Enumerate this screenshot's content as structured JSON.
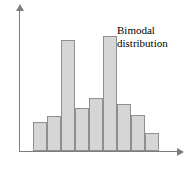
{
  "chart_data": {
    "type": "bar",
    "title": "",
    "subtitle": "",
    "xlabel": "",
    "ylabel": "",
    "categories": [
      "1",
      "2",
      "3",
      "4",
      "5",
      "6",
      "7",
      "8",
      "9"
    ],
    "values": [
      32,
      38,
      121,
      47,
      57,
      125,
      51,
      39,
      20
    ],
    "ylim": [
      0,
      140
    ],
    "grid": false,
    "legend": null,
    "annotations": [
      {
        "name": "bimodal-label",
        "line1": "Bimodal",
        "line2": "distribution"
      }
    ],
    "bar_fill": "#d6d6d6",
    "bar_stroke": "#8f8f8f",
    "axis_color": "#7d7d7d",
    "background": "#ffffff"
  },
  "axes": {
    "y_axis_name": "y-axis",
    "x_axis_name": "x-axis",
    "y_arrow": "arrow-up",
    "x_arrow": "arrow-right"
  }
}
